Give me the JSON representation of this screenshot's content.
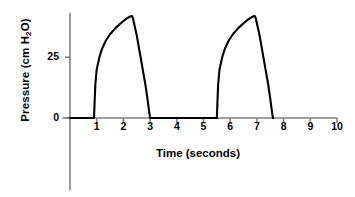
{
  "chart_data": {
    "type": "line",
    "title": "",
    "xlabel": "Time (seconds)",
    "ylabel": "Pressure (cm H2O)",
    "ylabel_parts": {
      "pre": "Pressure (cm H",
      "sub": "2",
      "post": "O)"
    },
    "xlim": [
      0,
      10
    ],
    "ylim": [
      0,
      45
    ],
    "xticks": [
      1,
      2,
      3,
      4,
      5,
      6,
      7,
      8,
      9,
      10
    ],
    "xtick_labels": [
      "1",
      "2",
      "3",
      "4",
      "5",
      "6",
      "7",
      "8",
      "9",
      "10"
    ],
    "yticks": [
      0,
      25
    ],
    "ytick_labels": [
      "0",
      "25"
    ],
    "grid": false,
    "legend": null,
    "line_color": "#000000",
    "axis_color": "#808080",
    "background_color": "#ffffff",
    "series": [
      {
        "name": "Airway pressure waveform",
        "description": "Two identical pressure-controlled breath cycles: rapid rise, convex rise to peak, then exponential decay to baseline, separated by flat zero-pressure intervals.",
        "points": [
          [
            0.0,
            0
          ],
          [
            0.9,
            0
          ],
          [
            0.92,
            6
          ],
          [
            0.95,
            14
          ],
          [
            1.0,
            20
          ],
          [
            1.1,
            25
          ],
          [
            1.2,
            28.5
          ],
          [
            1.35,
            32
          ],
          [
            1.5,
            34.5
          ],
          [
            1.7,
            37
          ],
          [
            1.9,
            39
          ],
          [
            2.1,
            40.8
          ],
          [
            2.25,
            41.8
          ],
          [
            2.32,
            42
          ],
          [
            2.36,
            41
          ],
          [
            2.42,
            38
          ],
          [
            2.5,
            34
          ],
          [
            2.58,
            29
          ],
          [
            2.66,
            24
          ],
          [
            2.74,
            19
          ],
          [
            2.82,
            14
          ],
          [
            2.9,
            8
          ],
          [
            2.96,
            3
          ],
          [
            3.0,
            0
          ],
          [
            5.5,
            0
          ],
          [
            5.52,
            6
          ],
          [
            5.55,
            14
          ],
          [
            5.6,
            20
          ],
          [
            5.7,
            25
          ],
          [
            5.8,
            28.5
          ],
          [
            5.95,
            32
          ],
          [
            6.1,
            34.5
          ],
          [
            6.3,
            37
          ],
          [
            6.5,
            39
          ],
          [
            6.7,
            40.8
          ],
          [
            6.85,
            41.8
          ],
          [
            6.92,
            42
          ],
          [
            6.96,
            41
          ],
          [
            7.02,
            38
          ],
          [
            7.1,
            34
          ],
          [
            7.18,
            29
          ],
          [
            7.26,
            24
          ],
          [
            7.34,
            19
          ],
          [
            7.42,
            14
          ],
          [
            7.5,
            8
          ],
          [
            7.56,
            3
          ],
          [
            7.6,
            0
          ]
        ]
      }
    ],
    "annotations": {
      "cycle_1": {
        "rise_time": 0.9,
        "peak_time": 2.32,
        "peak_value": 42,
        "end_time": 3.0
      },
      "cycle_2": {
        "rise_time": 5.5,
        "peak_time": 6.92,
        "peak_value": 42,
        "end_time": 7.6
      }
    }
  }
}
